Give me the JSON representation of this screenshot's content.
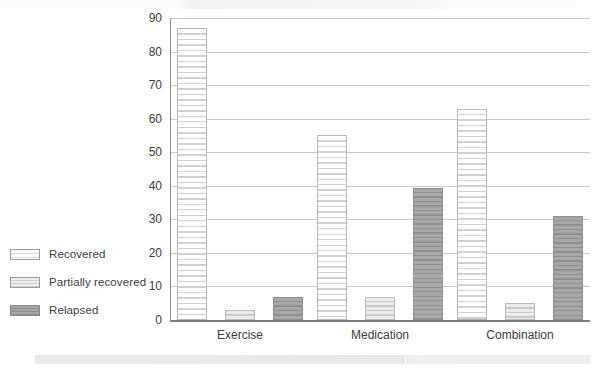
{
  "chart_data": {
    "type": "bar",
    "title": "",
    "subtitle": "",
    "xlabel": "",
    "ylabel": "",
    "categories": [
      "Exercise",
      "Medication",
      "Combination"
    ],
    "series": [
      {
        "name": "Recovered",
        "values": [
          87,
          55,
          63
        ],
        "fill": "white-striped",
        "color": "#ffffff"
      },
      {
        "name": "Partially recovered",
        "values": [
          3,
          7,
          5
        ],
        "fill": "lightgray-striped",
        "color": "#ebebeb"
      },
      {
        "name": "Relapsed",
        "values": [
          7,
          39.5,
          31
        ],
        "fill": "gray-striped",
        "color": "#a8a8a8"
      }
    ],
    "ylim": [
      0,
      90
    ],
    "ytick_values": [
      0,
      10,
      20,
      30,
      40,
      50,
      60,
      70,
      80,
      90
    ],
    "ytick_labels": [
      "0",
      "10",
      "20",
      "30",
      "40",
      "50",
      "60",
      "70",
      "80",
      "90"
    ],
    "grid": true,
    "grid_axis": "y",
    "legend_position": "left-outside",
    "bar_style": "horizontal-hatch",
    "annotations": []
  },
  "legend": {
    "items": [
      {
        "label": "Recovered",
        "swatch": "legend-swatch-recovered"
      },
      {
        "label": "Partially recovered",
        "swatch": "legend-swatch-partially-recovered"
      },
      {
        "label": "Relapsed",
        "swatch": "legend-swatch-relapsed"
      }
    ]
  },
  "colors": {
    "gridline": "#c8c8c8",
    "axis": "#8c8c8c",
    "text": "#3c3c3c",
    "recovered": "#ffffff",
    "partially_recovered": "#ebebeb",
    "relapsed": "#a8a8a8"
  }
}
